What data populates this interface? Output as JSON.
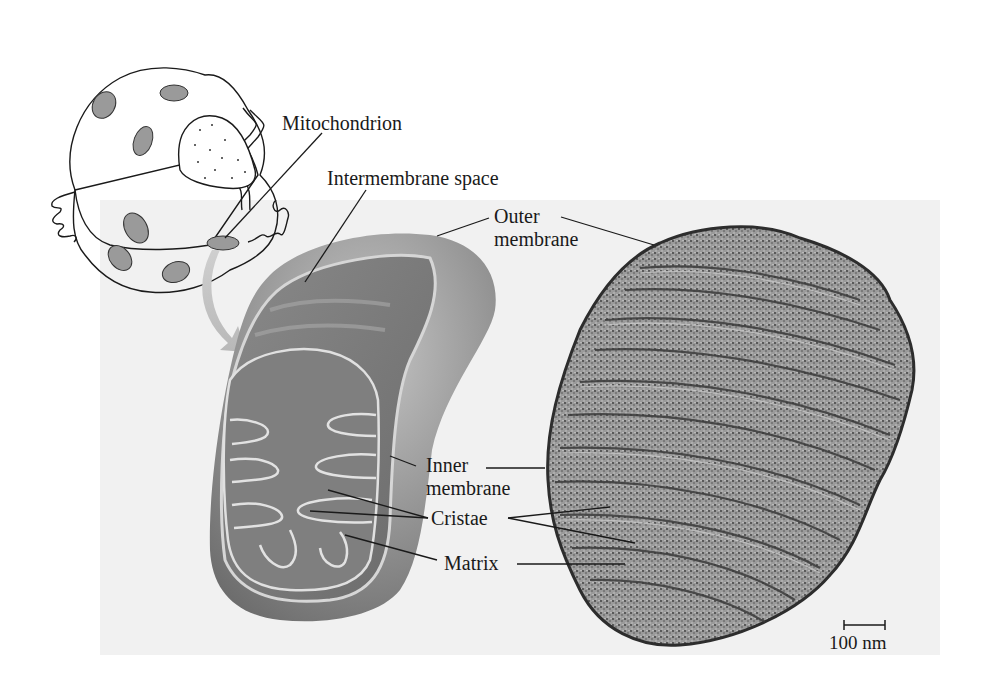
{
  "figure": {
    "labels": {
      "mitochondrion": "Mitochondrion",
      "intermembrane_space": "Intermembrane space",
      "outer_membrane_line1": "Outer",
      "outer_membrane_line2": "membrane",
      "inner_membrane_line1": "Inner",
      "inner_membrane_line2": "membrane",
      "cristae": "Cristae",
      "matrix": "Matrix"
    },
    "scale_bar": {
      "label": "100 nm"
    },
    "panels": [
      {
        "name": "cell-sketch",
        "description": "Line drawing of a cell containing mitochondria"
      },
      {
        "name": "mitochondrion-3d-cutaway",
        "description": "Cutaway rendering showing membranes, cristae and matrix"
      },
      {
        "name": "electron-micrograph",
        "description": "TEM image of a mitochondrion"
      }
    ],
    "colors": {
      "panel_background": "#f1f1f1",
      "mito_body": "#8c8c8c",
      "mito_light": "#b5b5b5",
      "membrane_highlight": "#d8d8d8",
      "micrograph_dark": "#3a3a3a",
      "micrograph_light": "#b9b9b9"
    }
  }
}
